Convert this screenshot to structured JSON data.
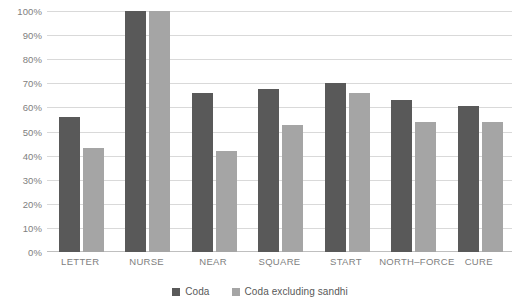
{
  "chart_data": {
    "type": "bar",
    "title": "",
    "subtitle": "",
    "xlabel": "",
    "ylabel": "",
    "ylim": [
      0,
      100
    ],
    "grid": true,
    "legend_position": "bottom",
    "categories": [
      "LETTER",
      "NURSE",
      "NEAR",
      "SQUARE",
      "START",
      "NORTH–FORCE",
      "CURE"
    ],
    "y_ticks": [
      "0%",
      "10%",
      "20%",
      "30%",
      "40%",
      "50%",
      "60%",
      "70%",
      "80%",
      "90%",
      "100%"
    ],
    "series": [
      {
        "name": "Coda",
        "color": "#595959",
        "values": [
          56,
          100,
          66,
          67.5,
          70,
          63,
          60.5
        ]
      },
      {
        "name": "Coda excluding sandhi",
        "color": "#a5a5a5",
        "values": [
          43,
          100,
          42,
          52.5,
          66,
          54,
          54
        ]
      }
    ]
  },
  "colors": {
    "series_dark": "#595959",
    "series_light": "#a5a5a5",
    "gridline": "#d9d9d9",
    "baseline": "#bfbfbf",
    "tick_text": "#808080",
    "legend_text": "#595959",
    "background": "#ffffff"
  }
}
